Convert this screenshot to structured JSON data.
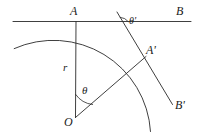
{
  "figure": {
    "type": "geometry-diagram",
    "background_color": "#ffffff",
    "stroke_color": "#2a2a2a",
    "labels": {
      "A": "A",
      "B": "B",
      "A_prime": "A'",
      "B_prime": "B'",
      "O": "O",
      "r": "r",
      "theta": "θ",
      "theta_prime": "θ'"
    },
    "points": {
      "O": {
        "x": 75,
        "y": 118,
        "name": "center"
      },
      "A": {
        "x": 76,
        "y": 21,
        "name": "tangent-point-top"
      },
      "A_prime": {
        "x": 145,
        "y": 58,
        "name": "tangent-point-rotated"
      },
      "B": {
        "x": 191,
        "y": 21,
        "name": "line-AB-end"
      },
      "B_prime": {
        "x": 172,
        "y": 104,
        "name": "line-ApBp-end"
      }
    },
    "circle": {
      "center_x": 75,
      "center_y": 118,
      "radius": 97
    },
    "angles": {
      "theta_deg": 45,
      "theta_prime_deg": 45
    }
  }
}
